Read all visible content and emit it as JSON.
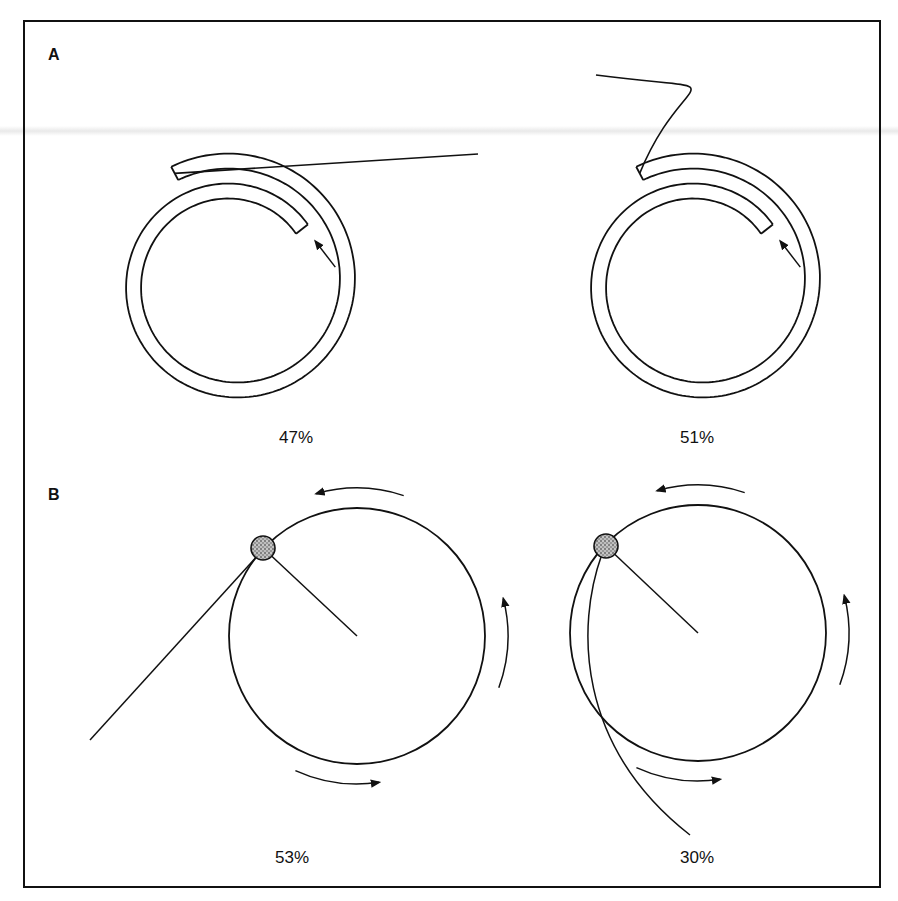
{
  "figure": {
    "border": {
      "x": 24,
      "y": 21,
      "w": 856,
      "h": 866
    },
    "stroke_color": "#111111",
    "ball_color": "#8a8a8a"
  },
  "panel_a": {
    "label": "A",
    "left": {
      "percent": "47%",
      "center": [
        233,
        283
      ],
      "start_radius": 80,
      "tube_width": 15,
      "pitch": 30,
      "start_angle_deg": -38,
      "sweep_deg": 440,
      "lead_end": [
        478,
        154
      ],
      "label_pos": [
        296,
        438
      ]
    },
    "right": {
      "percent": "51%",
      "center": [
        698,
        283
      ],
      "start_radius": 80,
      "tube_width": 15,
      "pitch": 30,
      "start_angle_deg": -38,
      "sweep_deg": 440,
      "lead_end": [
        596,
        75
      ],
      "label_pos": [
        697,
        438
      ]
    }
  },
  "panel_b": {
    "label": "B",
    "left": {
      "percent": "53%",
      "center": [
        357,
        636
      ],
      "radius": 128,
      "ball": [
        263,
        548
      ],
      "tail_end": [
        90,
        740
      ],
      "tail_curved": false,
      "label_pos": [
        292,
        858
      ]
    },
    "right": {
      "percent": "30%",
      "center": [
        698,
        633
      ],
      "radius": 128,
      "ball": [
        606,
        546
      ],
      "tail_end": [
        690,
        835
      ],
      "tail_curved": true,
      "label_pos": [
        697,
        858
      ]
    }
  }
}
